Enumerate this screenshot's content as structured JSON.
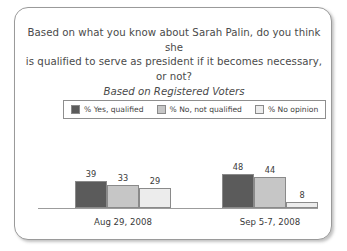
{
  "card": {
    "title_lines": [
      "Based on what you know about Sarah Palin, do you think she",
      "is qualified to serve as president if it becomes necessary, or not?"
    ],
    "subtitle": "Based on Registered Voters"
  },
  "colors": {
    "series_yes": "#5b5b5b",
    "series_no": "#c6c6c6",
    "series_noopinion": "#ececec",
    "border": "#8a8a8a",
    "axis": "#9c9c9c",
    "text": "#3a3a3a"
  },
  "chart_data": {
    "type": "bar",
    "title": "Based on what you know about Sarah Palin, do you think she is qualified to serve as president if it becomes necessary, or not?",
    "subtitle": "Based on Registered Voters",
    "xlabel": "",
    "ylabel": "",
    "ylim": [
      0,
      60
    ],
    "grid": false,
    "legend_position": "top-center",
    "categories": [
      "Aug 29, 2008",
      "Sep 5-7, 2008"
    ],
    "series": [
      {
        "name": "% Yes, qualified",
        "color": "#5b5b5b",
        "values": [
          39,
          48
        ]
      },
      {
        "name": "% No, not qualified",
        "color": "#c6c6c6",
        "values": [
          33,
          44
        ]
      },
      {
        "name": "% No opinion",
        "color": "#ececec",
        "values": [
          29,
          8
        ]
      }
    ]
  }
}
